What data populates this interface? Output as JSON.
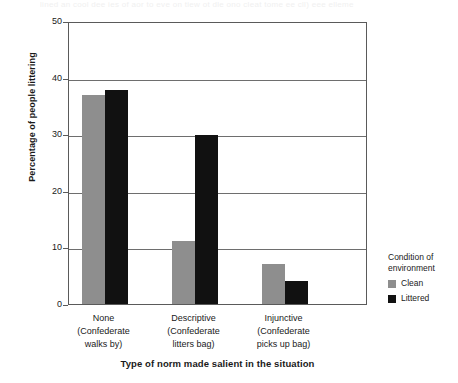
{
  "artifact": {
    "bleed_text": "lined an cool dee ies of aor to eve on tiew ot dle ono cleat tome ee cll) eee elleme"
  },
  "chart_data": {
    "type": "bar",
    "title": "",
    "subtitle": "",
    "xlabel": "Type of norm made salient in the situation",
    "ylabel": "Percentage of people littering",
    "ylim": [
      0,
      50
    ],
    "yticks": [
      0,
      10,
      20,
      30,
      40,
      50
    ],
    "ytick_labels": [
      "0",
      "10",
      "20",
      "30",
      "40",
      "50"
    ],
    "grid": true,
    "grid_axis": "y",
    "legend_position": "right",
    "legend_title_line1": "Condition of",
    "legend_title_line2": "environment",
    "categories": [
      {
        "line1": "None",
        "line2": "(Confederate",
        "line3": "walks by)"
      },
      {
        "line1": "Descriptive",
        "line2": "(Confederate",
        "line3": "litters bag)"
      },
      {
        "line1": "Injunctive",
        "line2": "(Confederate",
        "line3": "picks up bag)"
      }
    ],
    "series": [
      {
        "name": "Clean",
        "color": "#8e8e8e",
        "values": [
          36.9,
          11.2,
          7.0
        ]
      },
      {
        "name": "Littered",
        "color": "#111111",
        "values": [
          37.8,
          29.8,
          4.0
        ]
      }
    ]
  }
}
